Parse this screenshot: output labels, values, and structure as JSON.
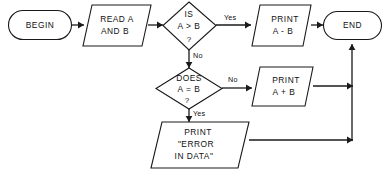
{
  "diagram": {
    "background_color": "#ffffff",
    "line_color": "#1a1a1a",
    "nodes": {
      "begin": {
        "shape": "terminator",
        "label": "BEGIN"
      },
      "read": {
        "shape": "parallelogram",
        "line1": "READ  A",
        "line2": "AND  B"
      },
      "decision_greater": {
        "shape": "diamond",
        "line1": "IS",
        "line2": "A > B",
        "line3": "?"
      },
      "print_minus": {
        "shape": "parallelogram",
        "line1": "PRINT",
        "line2": "A - B"
      },
      "end": {
        "shape": "terminator",
        "label": "END"
      },
      "decision_equal": {
        "shape": "diamond",
        "line1": "DOES",
        "line2": "A = B",
        "line3": "?"
      },
      "print_plus": {
        "shape": "parallelogram",
        "line1": "PRINT",
        "line2": "A + B"
      },
      "print_error": {
        "shape": "parallelogram",
        "line1": "PRINT",
        "line2": "\"ERROR",
        "line3": "IN   DATA\""
      }
    },
    "edge_labels": {
      "greater_yes": "Yes",
      "greater_no": "No",
      "equal_no": "No",
      "equal_yes": "Yes"
    }
  }
}
